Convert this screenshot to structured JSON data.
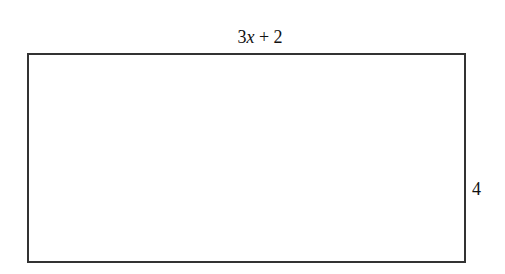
{
  "diagram": {
    "shape": "rectangle",
    "top_label": {
      "coef": "3",
      "var": "x",
      "rest": " + 2"
    },
    "right_label": "4"
  }
}
